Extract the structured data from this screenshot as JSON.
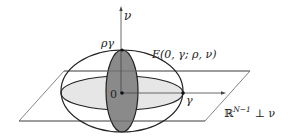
{
  "diagram": {
    "axis_label": "ν",
    "top_point_label": "ργ",
    "ellipsoid_label": "E(0, γ; ρ, ν)",
    "origin_label": "0",
    "gamma_label": "γ",
    "plane_label_base": "ℝ",
    "plane_label_sup": "N−1",
    "plane_label_suffix": "⊥ ν"
  },
  "colors": {
    "stroke": "#222222",
    "plane_stroke": "#555555",
    "dark_fill": "#8a8a8a",
    "light_fill": "#e6e6e6",
    "background": "#ffffff"
  }
}
